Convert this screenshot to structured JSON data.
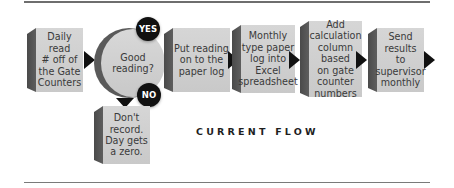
{
  "diagram": {
    "title": "CURRENT FLOW",
    "steps": [
      {
        "id": "step-1",
        "label": "Daily read\n# off of\nthe Gate\nCounters"
      },
      {
        "id": "decision",
        "label": "Good\nreading?"
      },
      {
        "id": "step-2",
        "label": "Put reading\non to the\npaper log"
      },
      {
        "id": "step-3",
        "label": "Monthly\ntype paper\nlog into\nExcel\nspreadsheet"
      },
      {
        "id": "step-4",
        "label": "Add\ncalculation\ncolumn\nbased\non gate\ncounter\nnumbers"
      },
      {
        "id": "step-5",
        "label": "Send results\nto\nsupervisor\nmonthly"
      },
      {
        "id": "no-branch",
        "label": "Don't\nrecord.\nDay gets\na zero."
      }
    ],
    "badges": {
      "yes": "YES",
      "no": "NO"
    },
    "icons": {
      "flow_arrow": "right-triangle-arrow",
      "branch_arrow": "down-triangle-arrow"
    },
    "colors": {
      "box_face": "#d0d0d0",
      "box_side": "#525252",
      "arrow": "#111111",
      "badge": "#111111",
      "text": "#3a3a3a",
      "rule": "#6e6e6e"
    }
  }
}
